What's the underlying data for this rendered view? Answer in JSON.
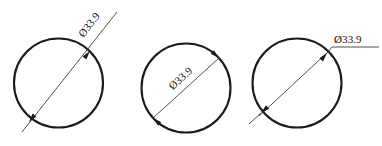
{
  "drawing": {
    "title": "Diameter dimensioning styles",
    "background_color": "#ffffff",
    "line_color": "#1a1a1a",
    "leader_color": "#3d3d3d",
    "text_color": "#111111",
    "diameter_symbol": "Ø",
    "figures": [
      {
        "id": "figure-1",
        "style": "outside-leader-rotated-text",
        "label": "Ø33.9",
        "circle": {
          "cx": 58.5,
          "cy": 83,
          "r": 44.5
        },
        "leader": {
          "x1": 22,
          "y1": 132,
          "x2": 117,
          "y2": 12
        },
        "arrows": [
          {
            "at": "upper-right-on-circle",
            "x": 90,
            "y": 51
          },
          {
            "at": "lower-left-on-circle",
            "x": 29,
            "y": 122
          }
        ],
        "text_rotation_deg": -51,
        "text_anchor": {
          "x": 92,
          "y": 27
        }
      },
      {
        "id": "figure-2",
        "style": "inside-dimension-line-rotated-text",
        "label": "Ø33.9",
        "circle": {
          "cx": 186,
          "cy": 88,
          "r": 44.5
        },
        "dimension_line": {
          "x1": 153,
          "y1": 118,
          "x2": 219,
          "y2": 58
        },
        "arrows": [
          {
            "at": "upper-right-on-circle",
            "x": 219,
            "y": 58
          },
          {
            "at": "lower-left-on-circle",
            "x": 153,
            "y": 118
          }
        ],
        "text_rotation_deg": -42,
        "text_anchor": {
          "x": 168,
          "y": 77
        }
      },
      {
        "id": "figure-3",
        "style": "outside-leader-shelf-horizontal-text",
        "label": "Ø33.9",
        "circle": {
          "cx": 297,
          "cy": 83,
          "r": 44.5
        },
        "diagonal": {
          "x1": 259,
          "y1": 115,
          "x2": 330,
          "y2": 53
        },
        "leader_shelf": {
          "x1": 330,
          "y1": 47,
          "x2": 379,
          "y2": 47
        },
        "leader_elbow": {
          "x1": 330,
          "y1": 47,
          "x2": 327,
          "y2": 52
        },
        "arrows": [
          {
            "at": "upper-right-on-circle",
            "x": 327,
            "y": 52
          },
          {
            "at": "lower-left-outside",
            "x": 256,
            "y": 118
          }
        ],
        "text_rotation_deg": 0,
        "text_anchor": {
          "x": 333,
          "y": 43
        }
      }
    ]
  }
}
